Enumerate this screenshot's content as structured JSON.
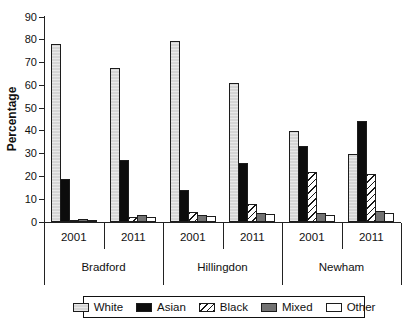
{
  "chart_data": {
    "type": "bar",
    "title": "",
    "ylabel": "Percentage",
    "ylim": [
      0,
      90
    ],
    "yticks": [
      0,
      10,
      20,
      30,
      40,
      50,
      60,
      70,
      80,
      90
    ],
    "grid": false,
    "legend_position": "bottom",
    "categories": [
      {
        "borough": "Bradford",
        "year": "2001"
      },
      {
        "borough": "Bradford",
        "year": "2011"
      },
      {
        "borough": "Hillingdon",
        "year": "2001"
      },
      {
        "borough": "Hillingdon",
        "year": "2011"
      },
      {
        "borough": "Newham",
        "year": "2001"
      },
      {
        "borough": "Newham",
        "year": "2011"
      }
    ],
    "group_labels": [
      "Bradford",
      "Hillingdon",
      "Newham"
    ],
    "year_labels": [
      "2001",
      "2011",
      "2001",
      "2011",
      "2001",
      "2011"
    ],
    "series": [
      {
        "name": "White",
        "pattern": "light-gray-dotted",
        "color": "#d5d5d5",
        "values": [
          78,
          67.5,
          79.5,
          61,
          40,
          30
        ]
      },
      {
        "name": "Asian",
        "pattern": "solid-black",
        "color": "#0c0c0c",
        "values": [
          19,
          27,
          14,
          26,
          33.5,
          44.5
        ]
      },
      {
        "name": "Black",
        "pattern": "diagonal-hatch",
        "color": "#ffffff",
        "values": [
          1,
          2,
          4.5,
          8,
          22,
          21
        ]
      },
      {
        "name": "Mixed",
        "pattern": "solid-dark-gray",
        "color": "#727272",
        "values": [
          1.5,
          3,
          3,
          4,
          4,
          5
        ]
      },
      {
        "name": "Other",
        "pattern": "solid-white",
        "color": "#ffffff",
        "values": [
          1,
          2,
          2.5,
          3.5,
          3,
          4
        ]
      }
    ],
    "axis_color": "#222222"
  }
}
